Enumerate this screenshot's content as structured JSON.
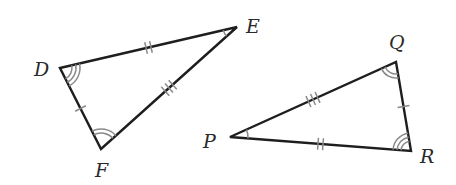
{
  "diagram": {
    "colors": {
      "side": "#1e1e1e",
      "mark": "#8a8a8a",
      "label": "#2a2a2a"
    },
    "triangles": [
      {
        "name": "DEF",
        "vertices": [
          {
            "label": "D",
            "angle_arcs": 3
          },
          {
            "label": "E",
            "angle_arcs": 1
          },
          {
            "label": "F",
            "angle_arcs": 2
          }
        ],
        "sides": [
          {
            "name": "DE",
            "ticks": 2
          },
          {
            "name": "EF",
            "ticks": 3
          },
          {
            "name": "DF",
            "ticks": 1
          }
        ]
      },
      {
        "name": "PQR",
        "vertices": [
          {
            "label": "P",
            "angle_arcs": 1
          },
          {
            "label": "Q",
            "angle_arcs": 2
          },
          {
            "label": "R",
            "angle_arcs": 3
          }
        ],
        "sides": [
          {
            "name": "PQ",
            "ticks": 3
          },
          {
            "name": "QR",
            "ticks": 1
          },
          {
            "name": "PR",
            "ticks": 2
          }
        ]
      }
    ]
  }
}
